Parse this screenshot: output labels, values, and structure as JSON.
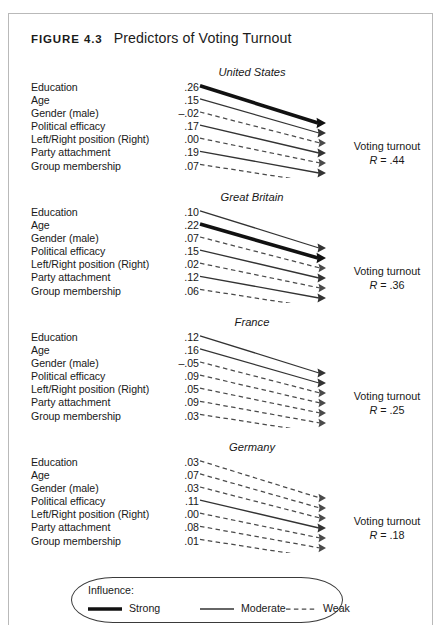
{
  "figure": {
    "number_label": "Figure 4.3",
    "caption": "Predictors of Voting Turnout",
    "outcome_label": "Voting turnout"
  },
  "predictors": [
    "Education",
    "Age",
    "Gender (male)",
    "Political efficacy",
    "Left/Right position (Right)",
    "Party attachment",
    "Group membership"
  ],
  "panels": [
    {
      "country": "United States",
      "r_label": "R = .44",
      "r_symbol": "R",
      "r_equals": " = .44",
      "values": [
        ".26",
        ".15",
        "–.02",
        ".17",
        ".00",
        ".19",
        ".07"
      ],
      "strengths": [
        "strong",
        "moderate",
        "weak",
        "moderate",
        "weak",
        "moderate",
        "weak"
      ]
    },
    {
      "country": "Great Britain",
      "r_label": "R = .36",
      "r_symbol": "R",
      "r_equals": " = .36",
      "values": [
        ".10",
        ".22",
        ".07",
        ".15",
        ".02",
        ".12",
        ".06"
      ],
      "strengths": [
        "moderate",
        "strong",
        "weak",
        "moderate",
        "weak",
        "moderate",
        "weak"
      ]
    },
    {
      "country": "France",
      "r_label": "R = .25",
      "r_symbol": "R",
      "r_equals": " = .25",
      "values": [
        ".12",
        ".16",
        "–.05",
        ".09",
        ".05",
        ".09",
        ".03"
      ],
      "strengths": [
        "moderate",
        "moderate",
        "weak",
        "weak",
        "weak",
        "weak",
        "weak"
      ]
    },
    {
      "country": "Germany",
      "r_label": "R = .18",
      "r_symbol": "R",
      "r_equals": " = .18",
      "values": [
        ".03",
        ".07",
        ".03",
        ".11",
        ".00",
        ".08",
        ".01"
      ],
      "strengths": [
        "weak",
        "weak",
        "weak",
        "moderate",
        "weak",
        "weak",
        "weak"
      ]
    }
  ],
  "legend": {
    "title": "Influence:",
    "items": [
      {
        "label": "Strong",
        "style": "strong"
      },
      {
        "label": "Moderate",
        "style": "moderate"
      },
      {
        "label": "Weak",
        "style": "weak"
      }
    ]
  },
  "chart_data": {
    "type": "diagram",
    "title": "Predictors of Voting Turnout",
    "outcome": "Voting turnout",
    "predictors": [
      "Education",
      "Age",
      "Gender (male)",
      "Political efficacy",
      "Left/Right position (Right)",
      "Party attachment",
      "Group membership"
    ],
    "series": [
      {
        "name": "United States",
        "R": 0.44,
        "values": [
          0.26,
          0.15,
          -0.02,
          0.17,
          0.0,
          0.19,
          0.07
        ]
      },
      {
        "name": "Great Britain",
        "R": 0.36,
        "values": [
          0.1,
          0.22,
          0.07,
          0.15,
          0.02,
          0.12,
          0.06
        ]
      },
      {
        "name": "France",
        "R": 0.25,
        "values": [
          0.12,
          0.16,
          -0.05,
          0.09,
          0.05,
          0.09,
          0.03
        ]
      },
      {
        "name": "Germany",
        "R": 0.18,
        "values": [
          0.03,
          0.07,
          0.03,
          0.11,
          0.0,
          0.08,
          0.01
        ]
      }
    ],
    "encoding": {
      "strong": "thick solid line",
      "moderate": "thin solid line",
      "weak": "dashed line"
    },
    "legend_position": "bottom-center"
  },
  "colors": {
    "ink": "#191919",
    "frame": "#b9b9b9",
    "legend_border": "#3a3a3a",
    "strong_line": "#111111",
    "moderate_line": "#333333",
    "weak_line": "#4a4a4a"
  }
}
